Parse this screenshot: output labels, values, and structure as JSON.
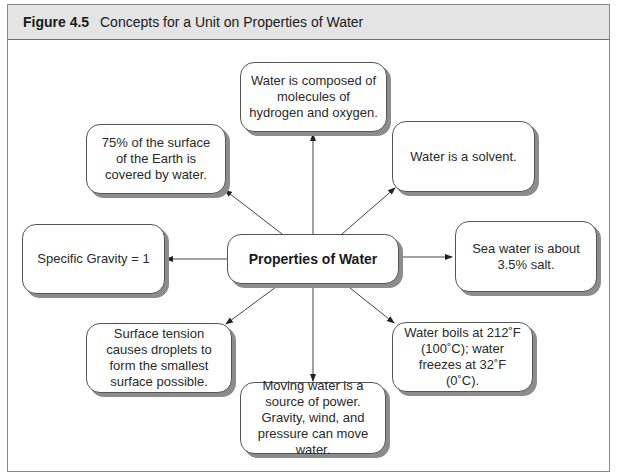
{
  "figure": {
    "number": "Figure 4.5",
    "title": "Concepts for a Unit on Properties of Water"
  },
  "center": {
    "label": "Properties of Water"
  },
  "nodes": {
    "top": "Water is composed of molecules of hydrogen and oxygen.",
    "top_left": "75% of the surface of the Earth is covered by water.",
    "top_right": "Water is a solvent.",
    "left": "Specific Gravity = 1",
    "right": "Sea water is about 3.5% salt.",
    "bottom_left": "Surface tension causes droplets to form the smallest surface possible.",
    "bottom": "Moving water is a source of power. Gravity, wind, and pressure can move water.",
    "bottom_right": "Water boils at 212˚F (100˚C); water freezes at 32˚F (0˚C)."
  },
  "colors": {
    "header_bg": "#e4e4e4",
    "border": "#555555",
    "shadow": "#8c8c8c"
  }
}
